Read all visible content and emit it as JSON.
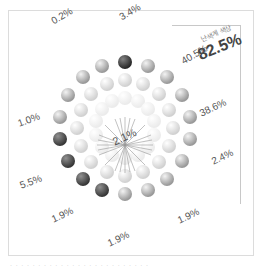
{
  "chart_data": {
    "type": "pie",
    "title": "",
    "style": "radial sphere infographic (balls arranged in spokes)",
    "highlight": {
      "caption": "난색계 색상",
      "value": "82.5%"
    },
    "center_label": "2.1%",
    "categories": [
      "top-left-1",
      "top-left-2",
      "top",
      "upper-right",
      "right",
      "lower-right",
      "bottom-right",
      "bottom",
      "bottom-left",
      "left-low",
      "left-high"
    ],
    "values": [
      0.2,
      3.4,
      40.5,
      38.6,
      2.4,
      1.9,
      1.9,
      1.9,
      5.5,
      1.0,
      2.1
    ],
    "labels": [
      {
        "text": "0.2%",
        "x": 52,
        "y": 18,
        "rot": -30
      },
      {
        "text": "3.4%",
        "x": 120,
        "y": 16,
        "rot": -30
      },
      {
        "text": "40.5%",
        "x": 182,
        "y": 62,
        "rot": -30
      },
      {
        "text": "38.6%",
        "x": 198,
        "y": 112,
        "rot": -25
      },
      {
        "text": "2.4%",
        "x": 210,
        "y": 158,
        "rot": -25
      },
      {
        "text": "1.9%",
        "x": 178,
        "y": 216,
        "rot": -25
      },
      {
        "text": "1.9%",
        "x": 112,
        "y": 238,
        "rot": -25
      },
      {
        "text": "1.9%",
        "x": 54,
        "y": 215,
        "rot": -25
      },
      {
        "text": "5.5%",
        "x": 20,
        "y": 180,
        "rot": -20
      },
      {
        "text": "1.0%",
        "x": 18,
        "y": 120,
        "rot": -20
      },
      {
        "text": "2.1%",
        "x": 113,
        "y": 140,
        "rot": -25
      }
    ]
  },
  "highlight_caption": "난색계 색상",
  "highlight_value": "82.5%",
  "center_value": "2.1%",
  "pct": [
    "0.2%",
    "3.4%",
    "40.5%",
    "38.6%",
    "2.4%",
    "1.9%",
    "1.9%",
    "1.9%",
    "5.5%",
    "1.0%"
  ],
  "footer_caption": "· · · · · · · · · · · · · · · · · · · · · · · · ·"
}
